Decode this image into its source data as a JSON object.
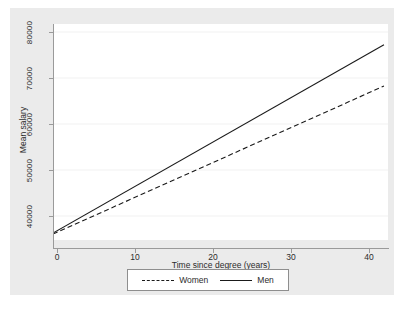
{
  "chart_data": {
    "type": "line",
    "title": "",
    "xlabel": "Time since degree (years)",
    "ylabel": "Mean salary",
    "xlim": [
      0,
      41.5
    ],
    "ylim": [
      35000,
      82000
    ],
    "xticks": [
      "0",
      "10",
      "20",
      "30",
      "40"
    ],
    "xtick_values": [
      0,
      10,
      20,
      30,
      40
    ],
    "yticks": [
      "40000",
      "50000",
      "60000",
      "70000",
      "80000"
    ],
    "ytick_values": [
      40000,
      50000,
      60000,
      70000,
      80000
    ],
    "grid": true,
    "grid_axis": "y",
    "legend_position": "bottom",
    "series": [
      {
        "name": "Women",
        "style": "dashed",
        "color": "#1a1a1a",
        "x": [
          0,
          41
        ],
        "values": [
          36300,
          68500
        ]
      },
      {
        "name": "Men",
        "style": "solid",
        "color": "#1a1a1a",
        "x": [
          0,
          41
        ],
        "values": [
          36500,
          77500
        ]
      }
    ]
  },
  "axes": {
    "y_title": "Mean salary",
    "x_title": "Time since degree (years)",
    "y_labels": [
      "40000",
      "50000",
      "60000",
      "70000",
      "80000"
    ],
    "x_labels": [
      "0",
      "10",
      "20",
      "30",
      "40"
    ]
  },
  "legend": {
    "entries": [
      {
        "label": "Women",
        "style": "dashed"
      },
      {
        "label": "Men",
        "style": "solid"
      }
    ]
  },
  "colors": {
    "canvas": "#ebebeb",
    "plot_background": "#ffffff",
    "axis": "#9a9a9a",
    "grid": "#f0f0f0",
    "line": "#1a1a1a",
    "text": "#2b2b2b"
  }
}
